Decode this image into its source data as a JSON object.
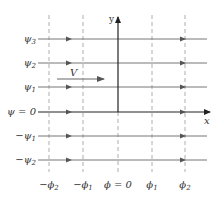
{
  "diagram": {
    "axes": {
      "x_label": "x",
      "y_label": "y"
    },
    "velocity_label": "V",
    "streamlines": [
      {
        "label": "ψ",
        "sub": "3",
        "prefix": "",
        "y": 39
      },
      {
        "label": "ψ",
        "sub": "2",
        "prefix": "",
        "y": 63
      },
      {
        "label": "ψ",
        "sub": "1",
        "prefix": "",
        "y": 87
      },
      {
        "label": "ψ = 0",
        "sub": "",
        "prefix": "",
        "y": 112
      },
      {
        "label": "ψ",
        "sub": "1",
        "prefix": "−",
        "y": 136
      },
      {
        "label": "ψ",
        "sub": "2",
        "prefix": "−",
        "y": 160
      }
    ],
    "equipotentials": [
      {
        "label": "ϕ",
        "sub": "2",
        "prefix": "−",
        "x": 49
      },
      {
        "label": "ϕ",
        "sub": "1",
        "prefix": "−",
        "x": 83
      },
      {
        "label": "ϕ = 0",
        "sub": "",
        "prefix": "",
        "x": 118
      },
      {
        "label": "ϕ",
        "sub": "1",
        "prefix": "",
        "x": 152
      },
      {
        "label": "ϕ",
        "sub": "2",
        "prefix": "",
        "x": 185
      }
    ],
    "colors": {
      "line": "#777777",
      "axis": "#222222",
      "dash": "#999999",
      "text": "#333333"
    }
  }
}
